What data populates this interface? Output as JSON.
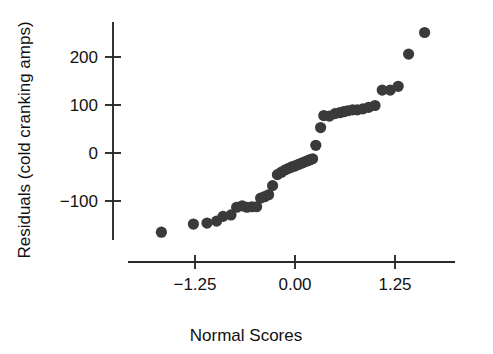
{
  "chart_data": {
    "type": "scatter",
    "title": "",
    "xlabel": "Normal Scores",
    "ylabel": "Residuals (cold cranking amps)",
    "xlim": [
      -1.85,
      1.7
    ],
    "ylim": [
      -230,
      290
    ],
    "grid": false,
    "legend": null,
    "xticks": [
      -1.25,
      0.0,
      1.25
    ],
    "xtick_labels": [
      "−1.25",
      "0.00",
      "1.25"
    ],
    "yticks": [
      -100,
      0,
      100,
      200
    ],
    "ytick_labels": [
      "−100",
      "0",
      "100",
      "200"
    ],
    "marker": {
      "shape": "circle",
      "color": "#3a3a3a",
      "size_px": 5.6
    },
    "x": [
      -1.67,
      -1.27,
      -1.1,
      -0.98,
      -0.9,
      -0.8,
      -0.73,
      -0.66,
      -0.6,
      -0.54,
      -0.48,
      -0.43,
      -0.38,
      -0.33,
      -0.28,
      -0.22,
      -0.17,
      -0.12,
      -0.08,
      -0.04,
      0.0,
      0.04,
      0.07,
      0.1,
      0.13,
      0.16,
      0.19,
      0.22,
      0.26,
      0.32,
      0.36,
      0.43,
      0.5,
      0.56,
      0.61,
      0.66,
      0.72,
      0.78,
      0.85,
      0.92,
      1.0,
      1.09,
      1.19,
      1.29,
      1.42,
      1.62
    ],
    "y": [
      -165,
      -148,
      -146,
      -142,
      -132,
      -129,
      -113,
      -110,
      -113,
      -112,
      -112,
      -94,
      -91,
      -87,
      -68,
      -45,
      -40,
      -35,
      -32,
      -29,
      -27,
      -24,
      -22,
      -20,
      -18,
      -16,
      -14,
      -12,
      16,
      53,
      78,
      77,
      82,
      84,
      86,
      88,
      90,
      90,
      92,
      95,
      99,
      131,
      131,
      139,
      206,
      251
    ],
    "points": [
      {
        "x": -1.67,
        "y": -165
      },
      {
        "x": -1.27,
        "y": -148
      },
      {
        "x": -1.1,
        "y": -146
      },
      {
        "x": -0.98,
        "y": -142
      },
      {
        "x": -0.9,
        "y": -132
      },
      {
        "x": -0.8,
        "y": -129
      },
      {
        "x": -0.73,
        "y": -113
      },
      {
        "x": -0.66,
        "y": -110
      },
      {
        "x": -0.6,
        "y": -113
      },
      {
        "x": -0.54,
        "y": -112
      },
      {
        "x": -0.48,
        "y": -112
      },
      {
        "x": -0.43,
        "y": -94
      },
      {
        "x": -0.38,
        "y": -91
      },
      {
        "x": -0.33,
        "y": -87
      },
      {
        "x": -0.28,
        "y": -68
      },
      {
        "x": -0.22,
        "y": -45
      },
      {
        "x": -0.17,
        "y": -40
      },
      {
        "x": -0.12,
        "y": -35
      },
      {
        "x": -0.08,
        "y": -32
      },
      {
        "x": -0.04,
        "y": -29
      },
      {
        "x": 0.0,
        "y": -27
      },
      {
        "x": 0.04,
        "y": -24
      },
      {
        "x": 0.07,
        "y": -22
      },
      {
        "x": 0.1,
        "y": -20
      },
      {
        "x": 0.13,
        "y": -18
      },
      {
        "x": 0.16,
        "y": -16
      },
      {
        "x": 0.19,
        "y": -14
      },
      {
        "x": 0.22,
        "y": -12
      },
      {
        "x": 0.26,
        "y": 16
      },
      {
        "x": 0.32,
        "y": 53
      },
      {
        "x": 0.36,
        "y": 78
      },
      {
        "x": 0.43,
        "y": 77
      },
      {
        "x": 0.5,
        "y": 82
      },
      {
        "x": 0.56,
        "y": 84
      },
      {
        "x": 0.61,
        "y": 86
      },
      {
        "x": 0.66,
        "y": 88
      },
      {
        "x": 0.72,
        "y": 90
      },
      {
        "x": 0.78,
        "y": 90
      },
      {
        "x": 0.85,
        "y": 92
      },
      {
        "x": 0.92,
        "y": 95
      },
      {
        "x": 1.0,
        "y": 99
      },
      {
        "x": 1.09,
        "y": 131
      },
      {
        "x": 1.19,
        "y": 131
      },
      {
        "x": 1.29,
        "y": 139
      },
      {
        "x": 1.42,
        "y": 206
      },
      {
        "x": 1.62,
        "y": 251
      }
    ]
  }
}
